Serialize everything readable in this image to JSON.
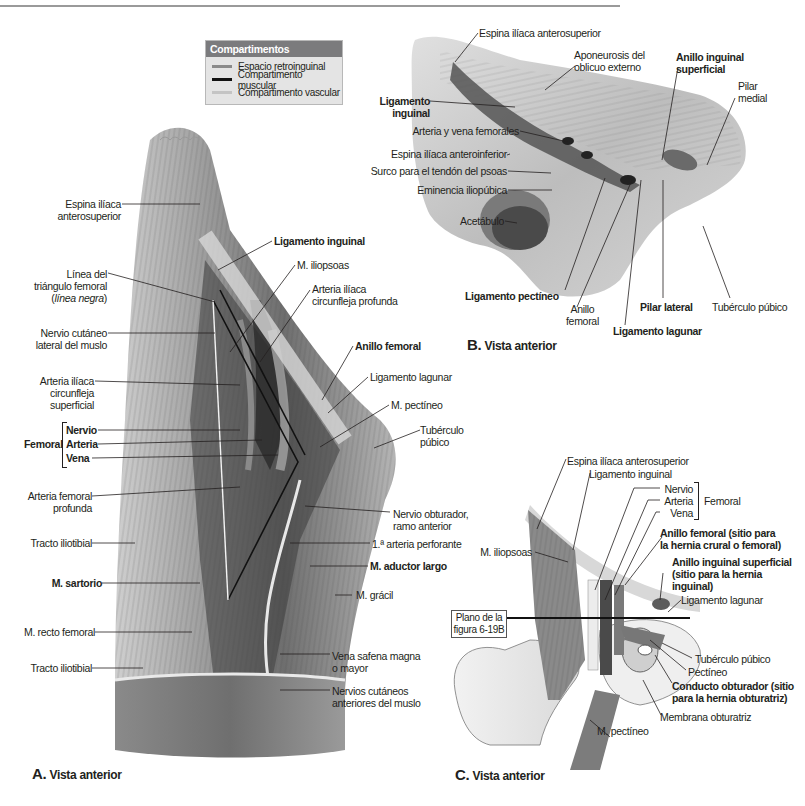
{
  "legend": {
    "title": "Compartimentos",
    "items": [
      {
        "label": "Espacio retroinguinal",
        "color": "#8a8a8a"
      },
      {
        "label": "Compartimento muscular",
        "color": "#111111"
      },
      {
        "label": "Compartimento vascular",
        "color": "#c4c4c4"
      }
    ]
  },
  "panel_a": {
    "caption_letter": "A.",
    "caption_text": "Vista anterior",
    "left_labels": {
      "espina_1": "Espina ilíaca",
      "espina_2": "anterosuperior",
      "linea_1": "Línea del",
      "linea_2": "triángulo femoral",
      "linea_3": "línea negra",
      "nervio_cut_1": "Nervio cutáneo",
      "nervio_cut_2": "lateral del muslo",
      "art_circ_sup_1": "Arteria ilíaca",
      "art_circ_sup_2": "circunfleja",
      "art_circ_sup_3": "superficial",
      "femoral_group": "Femoral",
      "nervio": "Nervio",
      "arteria": "Arteria",
      "vena": "Vena",
      "art_fem_prof_1": "Arteria femoral",
      "art_fem_prof_2": "profunda",
      "tracto_1": "Tracto iliotibial",
      "sartorio": "M. sartorio",
      "recto": "M. recto femoral",
      "tracto_2": "Tracto iliotibial"
    },
    "right_labels": {
      "lig_inguinal": "Ligamento inguinal",
      "iliopsoas": "M. iliopsoas",
      "art_circ_prof_1": "Arteria ilíaca",
      "art_circ_prof_2": "circunfleja profunda",
      "anillo_femoral": "Anillo femoral",
      "lig_lagunar": "Ligamento lagunar",
      "pectineo": "M. pectíneo",
      "tuberculo_1": "Tubérculo",
      "tuberculo_2": "púbico",
      "obturador_1": "Nervio obturador,",
      "obturador_2": "ramo anterior",
      "perforante": "1.ª arteria perforante",
      "aductor": "M. aductor largo",
      "gracil": "M. grácil",
      "safena_1": "Vena safena magna",
      "safena_2": "o mayor",
      "cutaneos_1": "Nervios cutáneos",
      "cutaneos_2": "anteriores del muslo"
    }
  },
  "panel_b": {
    "caption_letter": "B.",
    "caption_text": "Vista anterior",
    "labels": {
      "espina_sup": "Espina ilíaca anterosuperior",
      "aponeurosis_1": "Aponeurosis del",
      "aponeurosis_2": "oblicuo externo",
      "anillo_ing_1": "Anillo inguinal",
      "anillo_ing_2": "superficial",
      "pilar_medial_1": "Pilar",
      "pilar_medial_2": "medial",
      "lig_ing_1": "Ligamento",
      "lig_ing_2": "inguinal",
      "art_vena": "Arteria y vena femorales",
      "espina_inf": "Espina ilíaca anteroinferior",
      "surco": "Surco para el tendón del psoas",
      "eminencia": "Eminencia iliopúbica",
      "acetabulo": "Acetábulo",
      "lig_pectineo": "Ligamento pectíneo",
      "anillo_fem_1": "Anillo",
      "anillo_fem_2": "femoral",
      "pilar_lateral": "Pilar lateral",
      "lig_lagunar": "Ligamento lagunar",
      "tuberculo": "Tubérculo púbico"
    }
  },
  "panel_c": {
    "caption_letter": "C.",
    "caption_text": "Vista anterior",
    "plane_box_1": "Plano de la",
    "plane_box_2": "figura 6-19B",
    "labels": {
      "espina_sup": "Espina ilíaca anterosuperior",
      "lig_inguinal": "Ligamento inguinal",
      "nervio": "Nervio",
      "arteria": "Arteria",
      "vena": "Vena",
      "femoral_group": "Femoral",
      "anillo_fem_1": "Anillo femoral (sitio para",
      "anillo_fem_2": "la hernia crural o femoral)",
      "anillo_ing_1": "Anillo inguinal superficial",
      "anillo_ing_2": "(sitio para la hernia",
      "anillo_ing_3": "inguinal)",
      "iliopsoas": "M. iliopsoas",
      "lig_lagunar": "Ligamento lagunar",
      "tuberculo": "Tubérculo púbico",
      "pectineo": "Pectíneo",
      "conducto_1": "Conducto obturador (sitio",
      "conducto_2": "para la hernia obturatriz)",
      "membrana": "Membrana obturatriz",
      "m_pectineo": "M. pectíneo"
    }
  }
}
